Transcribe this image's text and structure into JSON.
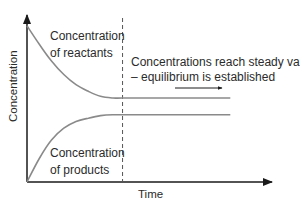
{
  "chart_data": {
    "type": "line",
    "title": "",
    "xlabel": "Time",
    "ylabel": "Concentration",
    "grid": false,
    "x_ticks": [],
    "y_ticks": [],
    "xlim": [
      0,
      1
    ],
    "ylim": [
      0,
      1
    ],
    "equilibrium_time": 0.39,
    "series": [
      {
        "name": "Concentration of reactants",
        "label_lines": [
          "Concentration",
          "of reactants"
        ],
        "color": "#8a8a8a",
        "x": [
          0,
          0.05,
          0.1,
          0.15,
          0.2,
          0.25,
          0.3,
          0.35,
          0.39,
          0.5,
          0.6,
          0.7,
          0.8,
          0.83
        ],
        "y": [
          0.93,
          0.82,
          0.72,
          0.64,
          0.58,
          0.54,
          0.51,
          0.5,
          0.5,
          0.5,
          0.5,
          0.5,
          0.5,
          0.5
        ]
      },
      {
        "name": "Concentration of products",
        "label_lines": [
          "Concentration",
          "of products"
        ],
        "color": "#8a8a8a",
        "x": [
          0,
          0.05,
          0.1,
          0.15,
          0.2,
          0.25,
          0.3,
          0.35,
          0.39,
          0.5,
          0.6,
          0.7,
          0.8,
          0.83
        ],
        "y": [
          0,
          0.14,
          0.25,
          0.32,
          0.36,
          0.38,
          0.395,
          0.4,
          0.4,
          0.4,
          0.4,
          0.4,
          0.4,
          0.4
        ]
      }
    ],
    "annotations": [
      {
        "text_lines": [
          "Concentrations reach steady values",
          "– equilibrium is established"
        ],
        "arrow": "right"
      }
    ]
  }
}
